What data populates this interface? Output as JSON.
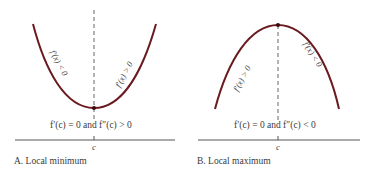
{
  "colors": {
    "curve": "#6b1a1f",
    "axis": "#555555",
    "dash": "#555555",
    "text": "#3a3a3a"
  },
  "panels": [
    {
      "id": "A",
      "caption": "A. Local minimum",
      "condition": "f′(c) = 0 and f″(c) > 0",
      "point_label": "c",
      "left_label": "f′(x) < 0",
      "right_label": "f′(x) > 0",
      "curve_shape": "concave-up"
    },
    {
      "id": "B",
      "caption": "B. Local maximum",
      "condition": "f′(c) = 0 and f″(c) < 0",
      "point_label": "c",
      "left_label": "f′(x) > 0",
      "right_label": "f′(x) < 0",
      "curve_shape": "concave-down"
    }
  ]
}
